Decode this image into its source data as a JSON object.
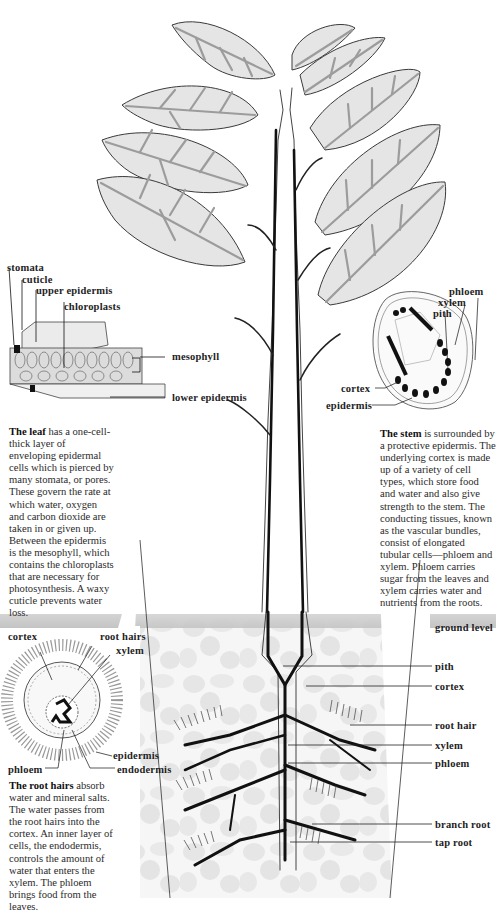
{
  "diagram": {
    "colors": {
      "leaf_fill": "#e4e4e4",
      "leaf_vein": "#9a9a9a",
      "outline": "#3a3a3a",
      "vascular": "#111111",
      "soil_band": "#c9c9c9",
      "soil_pebble": "#e8e8e8",
      "background": "#ffffff"
    },
    "leaf_section": {
      "labels": {
        "stomata": "stomata",
        "cuticle": "cuticle",
        "upper_epidermis": "upper epidermis",
        "chloroplasts": "chloroplasts",
        "mesophyll": "mesophyll",
        "lower_epidermis": "lower epidermis"
      },
      "caption": {
        "title": "The leaf",
        "body": " has a one-cell-thick layer of enveloping epidermal cells which is pierced by many stomata, or pores. These govern the rate at which water, oxygen and carbon dioxide are taken in or given up. Between the epidermis is the mesophyll, which contains the chloroplasts that are necessary for photosynthesis. A waxy cuticle prevents water loss."
      }
    },
    "stem_section": {
      "labels": {
        "phloem": "phloem",
        "xylem": "xylem",
        "pith": "pith",
        "cortex": "cortex",
        "epidermis": "epidermis"
      },
      "caption": {
        "title": "The stem",
        "body": " is surrounded by a protective epidermis. The underlying cortex is made up of a variety of cell types, which store food and water and also give strength to the stem. The conducting tissues, known as the vascular bundles, consist of elongated tubular cells—phloem and xylem. Phloem carries sugar from the leaves and xylem carries water and nutrients from the roots."
      }
    },
    "root_hair_section": {
      "labels": {
        "cortex": "cortex",
        "root_hairs": "root hairs",
        "xylem": "xylem",
        "epidermis": "epidermis",
        "endodermis": "endodermis",
        "phloem": "phloem"
      },
      "caption": {
        "title": "The root hairs",
        "body": " absorb water and mineral salts. The water passes from the root hairs into the cortex. An inner layer of cells, the endodermis, controls the amount of water that enters the xylem. The phloem brings food from the leaves."
      }
    },
    "root_system": {
      "labels": {
        "ground_level": "ground level",
        "pith": "pith",
        "cortex": "cortex",
        "root_hair": "root hair",
        "xylem": "xylem",
        "phloem": "phloem",
        "branch_root": "branch root",
        "tap_root": "tap root"
      }
    }
  }
}
